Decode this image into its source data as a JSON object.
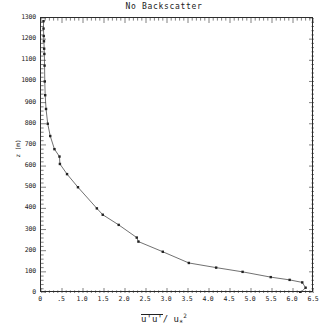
{
  "chart_data": {
    "type": "line",
    "title": "No Backscatter",
    "xlabel": "u'u'/u*^2",
    "ylabel": "z (m)",
    "xlim": [
      0,
      6.5
    ],
    "ylim": [
      0,
      1300
    ],
    "grid": false,
    "legend": null,
    "xticks": [
      0,
      0.5,
      1.0,
      1.5,
      2.0,
      2.5,
      3.0,
      3.5,
      4.0,
      4.5,
      5.0,
      5.5,
      6.0,
      6.5
    ],
    "xticklabels": [
      "0",
      ".5",
      "1.0",
      "1.5",
      "2.0",
      "2.5",
      "3.0",
      "3.5",
      "4.0",
      "4.5",
      "5.0",
      "5.5",
      "6.0",
      "6.5"
    ],
    "yticks": [
      0,
      100,
      200,
      300,
      400,
      500,
      600,
      700,
      800,
      900,
      1000,
      1100,
      1200,
      1300
    ],
    "yticklabels": [
      "0",
      "100",
      "200",
      "300",
      "400",
      "500",
      "600",
      "700",
      "800",
      "900",
      "1000",
      "1100",
      "1200",
      "1300"
    ],
    "series": [
      {
        "name": "u'u'/u*^2",
        "marker": "square",
        "x": [
          6.17,
          6.3,
          6.22,
          5.92,
          5.47,
          4.8,
          4.17,
          3.52,
          2.9,
          2.32,
          2.28,
          1.85,
          1.47,
          1.33,
          0.88,
          0.62,
          0.45,
          0.44,
          0.32,
          0.22,
          0.16,
          0.12,
          0.1,
          0.09,
          0.085,
          0.08,
          0.075,
          0.07,
          0.065,
          0.06,
          0.06
        ],
        "y": [
          0,
          25,
          50,
          62,
          75,
          100,
          120,
          142,
          195,
          243,
          262,
          322,
          370,
          400,
          500,
          562,
          610,
          645,
          680,
          742,
          800,
          870,
          935,
          1000,
          1075,
          1130,
          1155,
          1190,
          1215,
          1250,
          1285
        ]
      }
    ]
  },
  "axis_titles": {
    "x_numerator": "u'u'",
    "x_divider": "/ u",
    "x_sub": "*",
    "x_sup": "2",
    "y": "z (m)"
  }
}
